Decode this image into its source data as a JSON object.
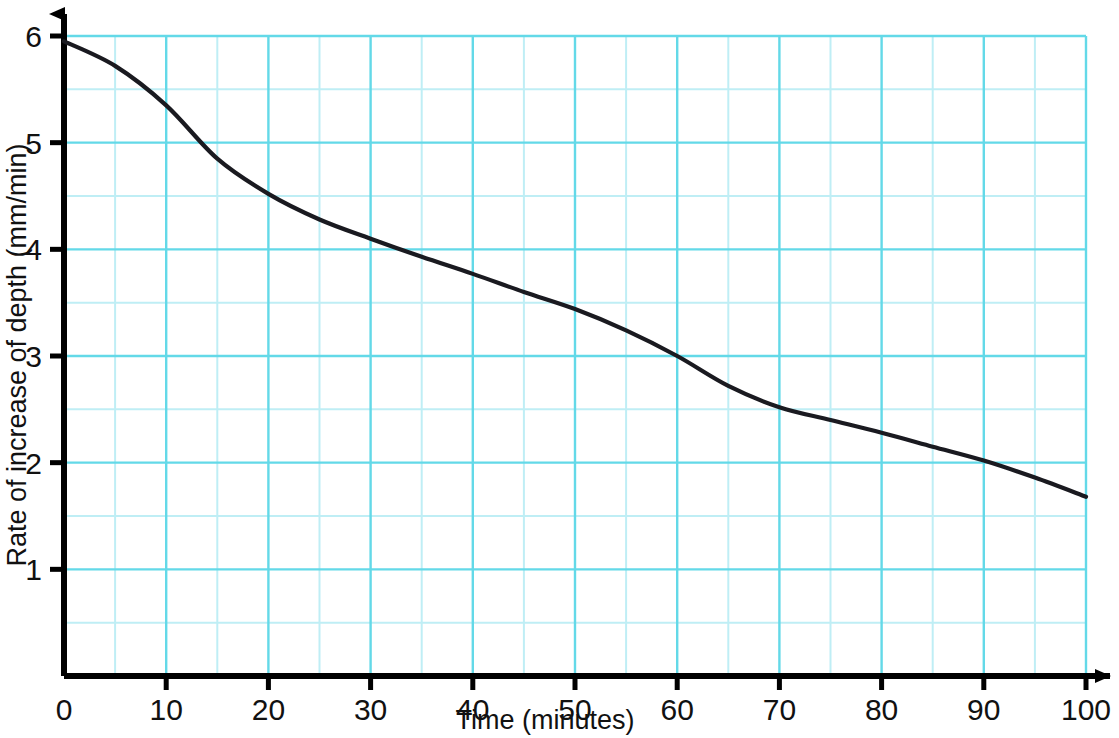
{
  "chart_data": {
    "type": "line",
    "title": "",
    "xlabel": "Time (minutes)",
    "ylabel": "Rate of increase of depth (mm/min)",
    "xlim": [
      0,
      100
    ],
    "ylim": [
      0,
      6
    ],
    "grid": true,
    "legend": "none",
    "x_ticks": [
      "0",
      "10",
      "20",
      "30",
      "40",
      "50",
      "60",
      "70",
      "80",
      "90",
      "100"
    ],
    "x_tick_values": [
      0,
      10,
      20,
      30,
      40,
      50,
      60,
      70,
      80,
      90,
      100
    ],
    "y_ticks": [
      "1",
      "2",
      "3",
      "4",
      "5",
      "6"
    ],
    "y_tick_values": [
      1,
      2,
      3,
      4,
      5,
      6
    ],
    "x_minor_step": 5,
    "y_minor_step": 0.5,
    "x": [
      0,
      5,
      10,
      15,
      20,
      25,
      30,
      35,
      40,
      45,
      50,
      55,
      60,
      65,
      70,
      75,
      80,
      85,
      90,
      95,
      100
    ],
    "values": [
      5.95,
      5.72,
      5.35,
      4.85,
      4.52,
      4.28,
      4.1,
      3.93,
      3.77,
      3.6,
      3.44,
      3.24,
      3.0,
      2.72,
      2.52,
      2.4,
      2.28,
      2.15,
      2.02,
      1.86,
      1.68
    ],
    "series": [
      {
        "name": "Rate of increase of depth",
        "color": "#1a1a20",
        "values": [
          5.95,
          5.72,
          5.35,
          4.85,
          4.52,
          4.28,
          4.1,
          3.93,
          3.77,
          3.6,
          3.44,
          3.24,
          3.0,
          2.72,
          2.52,
          2.4,
          2.28,
          2.15,
          2.02,
          1.86,
          1.68
        ]
      }
    ],
    "colors": {
      "curve": "#1a1a20",
      "axis": "#000000",
      "grid_major": "#63d9e8",
      "grid_minor": "#bfeef5",
      "background": "#ffffff"
    }
  }
}
